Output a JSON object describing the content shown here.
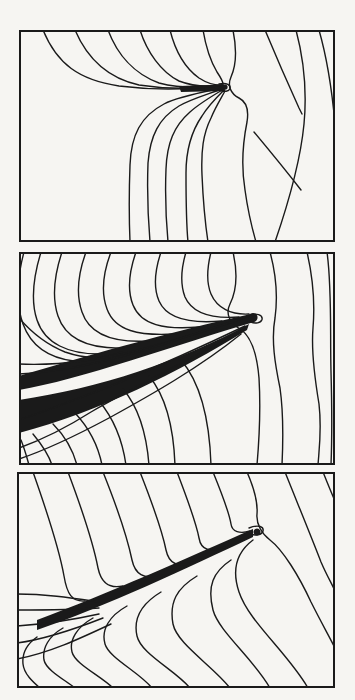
{
  "figure": {
    "paper_color": "#f6f5f2",
    "ink_color": "#1a1a1a",
    "frame_stroke_width": 2,
    "line_stroke_width": 1.4
  },
  "panels": [
    {
      "name": "panel-1",
      "frame": {
        "x": 19,
        "y": 30,
        "width": 316,
        "height": 212
      },
      "fills": [
        "M 160,56 L 205,54.5 L 206,61 L 162,62 Z",
        "M 206,54.5 a 2.6,2.6 0 1 0 0.1,0 Z"
      ],
      "strokes": [
        "M 24,0 C 38,34 60,50 100,56 C 140,61 180,58.5 203,55.5",
        "M 56,0 C 68,28 88,48 120,55 C 155,60.5 185,58 203,55.5",
        "M 89,0 C 98,24 115,44 140,53 C 165,59.5 188,57.5 203,55.5",
        "M 121,0 C 128,22 142,42 160,51 C 178,58 193,56.5 203,55",
        "M 151,0 C 156,20 166,38 180,48 C 190,54.5 198,55.5 204,55",
        "M 184,0 C 187,18 192,32 198,42 C 202,48 204,51 204,54",
        "M 200,54 C 208,52.5 212,55 211,58.5 C 210,61.5 205,62 202,60.5",
        "M 204,58 C 185,62 160,66 145,74 C 122,86 112,105 111,135 C 110,162 110,188 111,212",
        "M 204,58.5 C 190,64 172,69 160,76 C 140,88 131,106 129,133 C 128,160 129,188 131,212",
        "M 205,59 C 193,66 181,73 171,82 C 155,96 148,113 147,139 C 146,164 147,190 149,212",
        "M 205,60 C 197,68 189,76 183,86 C 172,102 167,119 167,143 C 167,167 167,191 169,212",
        "M 206,61 C 201,70 196,78 192,88 C 184,104 182,121 183,145 C 184,169 186,192 189,212",
        "M 214,0 C 218,20 217,36 212,47 C 208,56 212,64 220,68 C 228,72 230,80 228,92 C 224,112 222,136 226,160 C 229,182 233,198 237,212",
        "M 246,0 C 256,24 270,56 280,78 L 283,84",
        "M 235,102 C 250,120 268,142 282,160",
        "M 277,0 C 285,30 288,62 285,94 C 281,136 267,180 256,212",
        "M 300,0 C 308,28 313,60 316,94"
      ]
    },
    {
      "name": "panel-2",
      "frame": {
        "x": 19,
        "y": 252,
        "width": 316,
        "height": 213
      },
      "fills": [
        "M 0,124 C 60,106 150,80 232,62 L 235,70 C 160,92 60,128 0,138 Z",
        "M 0,148 C 80,136 160,110 230,72 L 228,78 C 160,120 80,160 0,181 Z",
        "M 234,61 a 4.5,4.5 0 1 0 0.1,0 Z"
      ],
      "strokes": [
        "M 5,0 C -2,26 -3,52 4,72 C 12,94 30,106 55,109",
        "M 22,0 C 14,26 12,50 18,68 C 26,92 50,102 80,102",
        "M 43,0 C 35,24 33,46 39,64 C 47,88 72,97 105,96",
        "M 67,0 C 59,22 57,43 63,60 C 71,84 96,91 130,89",
        "M 92,0 C 84,21 82,41 88,57 C 96,79 120,84 155,82",
        "M 117,0 C 110,20 108,38 114,53 C 122,73 145,78 180,75",
        "M 142,0 C 136,18 134,35 140,49 C 148,67 170,72 203,69",
        "M 167,0 C 162,17 161,32 166,45 C 173,61 192,67 220,65",
        "M 192,0 C 188,16 187,30 192,42 C 198,56 212,63 230,62",
        "M 0,66 C 12,80 26,92 46,100 C 66,107 85,107 103,100",
        "M 0,112 C 40,114 80,108 120,98 C 150,90 190,78 225,66",
        "M 0,122 C 45,120 95,108 145,92 C 175,82 205,72 230,64",
        "M 0,168 C 30,158 60,146 92,134 C 130,118 180,96 226,74",
        "M 0,196 C 25,187 50,174 72,160 C 110,138 170,108 224,78",
        "M 0,207 C 30,197 62,181 90,166 C 130,144 180,116 222,82",
        "M 2,188 C 6,198 8,206 10,213",
        "M 14,182 C 24,194 30,204 33,213",
        "M 34,172 C 48,186 55,202 58,213",
        "M 56,161 C 72,178 80,198 83,213",
        "M 80,149 C 96,168 104,192 107,213",
        "M 104,137 C 122,158 128,188 130,213",
        "M 130,124 C 150,148 155,186 156,213",
        "M 162,108 C 186,136 191,182 192,213",
        "M 228,64 C 238,60 244,63 243,67.5 C 242,71 236,72 232,70",
        "M 214,0 C 219,22 217,40 211,52 C 206,62 211,71 221,77 C 232,84 238,102 240,126 C 242,160 240,190 238,213",
        "M 251,0 C 257,22 259,44 256,66 C 252,88 256,112 261,136 C 265,164 264,192 263,213",
        "M 288,0 C 294,26 296,52 294,76 C 292,100 296,128 300,152 C 303,178 300,198 299,213",
        "M 308,0 C 313,36 311,80 312,120 C 313,156 313,188 312,213"
      ]
    },
    {
      "name": "panel-3",
      "frame": {
        "x": 17,
        "y": 472,
        "width": 318,
        "height": 216
      },
      "fills": [
        "M 20,148 C 90,122 170,86 236,57 L 236,65 C 170,96 90,134 20,158 Z",
        "M 240,56.5 a 3.5,3.5 0 1 0 0.1,0 Z"
      ],
      "strokes": [
        "M 0,122 C 30,122 55,126 82,130",
        "M 0,138 C 30,138 55,138 82,136",
        "M 0,154 C 30,152 55,148 82,142",
        "M 0,171 C 30,167 58,157 86,146",
        "M 0,187 C 32,181 62,167 94,152",
        "M 16,0 C 28,34 42,76 47,104 C 50,122 55,130 68,129",
        "M 51,0 C 63,32 76,70 81,96 C 84,110 91,117 106,114",
        "M 86,0 C 98,30 110,64 115,88 C 118,102 127,108 142,103",
        "M 123,0 C 134,28 145,58 149,78 C 152,92 161,96 176,90",
        "M 160,0 C 170,26 179,50 182,66 C 184,78 193,81 208,75",
        "M 196,0 C 205,22 212,40 214,52 C 215,60 223,62 233,59",
        "M 232,56 C 242,52 247,55 246,59 C 245,63 238,64 234,62",
        "M 20,165 C 10,172 5,182 6,192 C 7,202 16,210 23,216",
        "M 46,156 C 32,164 25,176 27,188 C 29,198 48,208 58,216",
        "M 76,146 C 60,155 52,168 55,180 C 58,192 84,204 96,216",
        "M 110,134 C 92,144 84,158 88,172 C 92,186 122,200 135,216",
        "M 144,120 C 124,132 116,146 120,164 C 124,182 158,198 173,216",
        "M 180,104 C 160,116 152,130 156,152 C 160,172 196,194 213,216",
        "M 214,88 C 196,100 190,114 196,138 C 202,160 236,186 253,216",
        "M 236,68 C 220,80 214,96 222,120 C 232,150 270,180 291,216",
        "M 230,0 C 237,16 241,30 240,42 C 239,52 245,62 253,68 C 266,78 282,104 294,130 C 304,150 312,164 318,176",
        "M 268,0 C 280,30 294,64 304,90 C 310,104 315,112 318,119",
        "M 306,0 C 310,10 314,20 318,29"
      ]
    }
  ]
}
